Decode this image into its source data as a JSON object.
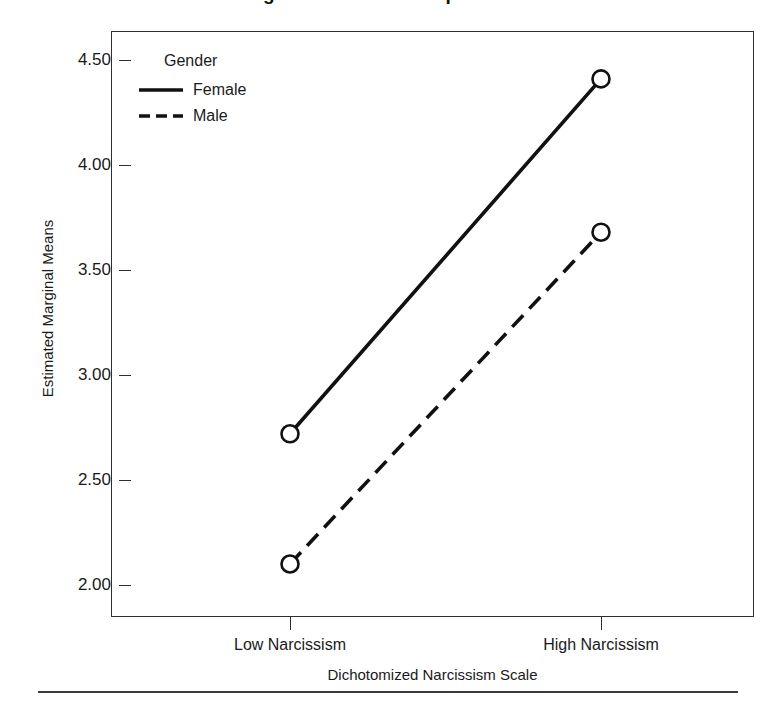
{
  "figure": {
    "title_remnant": "Marginal Means of Self-promotion",
    "bottom_rule": "horizontal-rule"
  },
  "legend": {
    "title": "Gender",
    "position": "top-left-inside",
    "entries": [
      {
        "label": "Female",
        "style": "solid"
      },
      {
        "label": "Male",
        "style": "dashed"
      }
    ]
  },
  "chart_data": {
    "type": "line",
    "title": "",
    "subtitle": "",
    "xlabel": "Dichotomized Narcissism Scale",
    "ylabel": "Estimated Marginal Means",
    "categories": [
      "Low Narcissism",
      "High Narcissism"
    ],
    "yticks": [
      "2.00",
      "2.50",
      "3.00",
      "3.50",
      "4.00",
      "4.50"
    ],
    "ytick_values": [
      2.0,
      2.5,
      3.0,
      3.5,
      4.0,
      4.5
    ],
    "ylim": [
      1.845,
      4.645
    ],
    "grid": false,
    "markers": "open-circle",
    "series": [
      {
        "name": "Female",
        "style": "solid",
        "values": [
          2.72,
          4.41
        ]
      },
      {
        "name": "Male",
        "style": "dashed",
        "values": [
          2.1,
          3.68
        ]
      }
    ]
  }
}
